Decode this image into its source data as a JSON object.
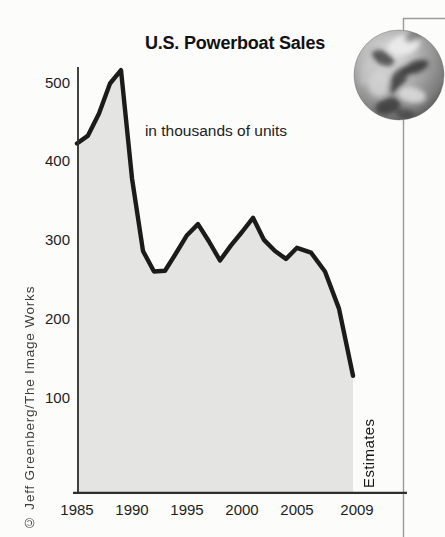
{
  "page": {
    "credit": "© Jeff Greenberg/The Image Works"
  },
  "decorations": {
    "globe_icon": "grayscale-earth-photo",
    "frame_rules": "thin gray page border at top-right and right edge"
  },
  "chart_data": {
    "type": "area",
    "title": "U.S. Powerboat Sales",
    "subtitle": "in thousands of units",
    "unit": "thousands of units",
    "x": [
      1985,
      1986,
      1987,
      1988,
      1989,
      1990,
      1991,
      1992,
      1993,
      1994,
      1995,
      1996,
      1997,
      1998,
      1999,
      2000,
      2001,
      2002,
      2003,
      2004,
      2005,
      2006,
      2007,
      2008,
      2009
    ],
    "values": [
      424,
      434,
      462,
      500,
      517,
      380,
      288,
      262,
      263,
      285,
      308,
      322,
      300,
      276,
      295,
      312,
      330,
      302,
      288,
      278,
      292,
      286,
      262,
      215,
      130
    ],
    "x_ticks": [
      "1985",
      "1990",
      "1995",
      "2000",
      "2005",
      "2009"
    ],
    "y_ticks": [
      "500",
      "400",
      "300",
      "200",
      "100"
    ],
    "xlabel": "",
    "ylabel": "",
    "ylim": [
      0,
      540
    ],
    "xlim": [
      1985,
      2009
    ],
    "grid": false,
    "legend": false,
    "annotations": [
      "Estimates"
    ],
    "annotation_note": "final 2009 value is an estimate",
    "colors": {
      "fill": "#e4e4e3",
      "line": "#1b1b1b",
      "axis": "#2e2e2e",
      "rule": "#9a9a9a",
      "background": "#fcfcfb"
    }
  }
}
